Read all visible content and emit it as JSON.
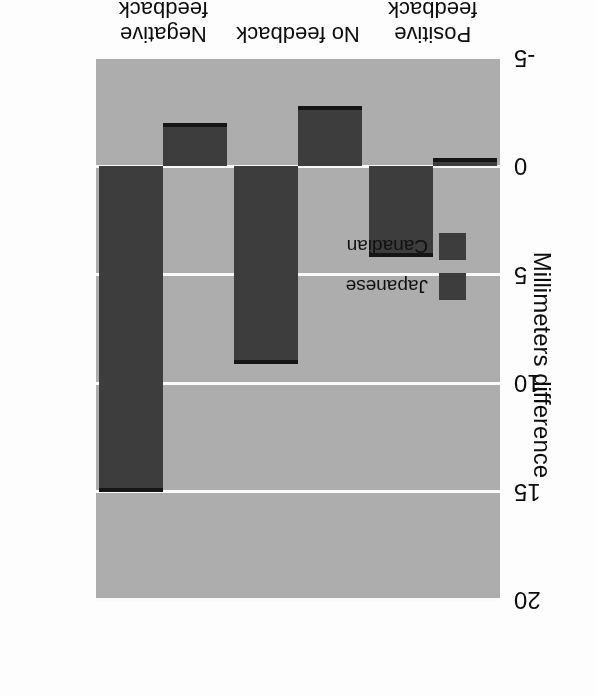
{
  "chart_data": {
    "type": "bar",
    "title": "",
    "xlabel": "",
    "ylabel": "Millimeters difference",
    "categories": [
      "Positive feedback",
      "No feedback",
      "Negative feedback"
    ],
    "category_lines": [
      [
        "Positive",
        "feedback"
      ],
      [
        "No feedback",
        ""
      ],
      [
        "Negative",
        "feedback"
      ]
    ],
    "series": [
      {
        "name": "Japanese",
        "values": [
          -0.4,
          -2.8,
          -2.0
        ]
      },
      {
        "name": "Canadian",
        "values": [
          4.2,
          9.1,
          15.0
        ]
      }
    ],
    "ylim": [
      -5,
      20
    ],
    "yticks": [
      20,
      15,
      10,
      5,
      0,
      -5
    ],
    "ytick_labels": [
      "20",
      "15",
      "10",
      "5",
      "0",
      "-5"
    ],
    "grid": "horizontal-white-lines",
    "legend_position": "upper-left-inside",
    "orientation": "vertical-grouped",
    "page_rotation_degrees": 180
  },
  "style": {
    "panel_background": "#adadad",
    "gridline_color": "#fafafa",
    "bar_fill": "#3d3d3d",
    "bar_edge": "#151515",
    "text_color": "#0d0d0d",
    "page_background": "#fdfdfd"
  },
  "legend": {
    "items": [
      {
        "label": "Japanese",
        "swatch_color": "#3d3d3d"
      },
      {
        "label": "Canadian",
        "swatch_color": "#3d3d3d"
      }
    ]
  },
  "axis": {
    "y_title": "Millimeters difference",
    "y_ticks": [
      "20",
      "15",
      "10",
      "5",
      "0",
      "-5"
    ]
  }
}
